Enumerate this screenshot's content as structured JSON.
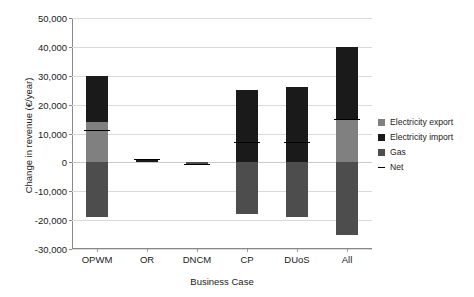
{
  "chart_data": {
    "type": "bar",
    "subtype": "stacked-bar-with-negative",
    "title": "",
    "xlabel": "Business Case",
    "ylabel": "Change in revenue (€/year)",
    "categories": [
      "OPWM",
      "OR",
      "DNCM",
      "CP",
      "DUoS",
      "All"
    ],
    "ylim": [
      -30000,
      50000
    ],
    "ytick_step": 10000,
    "ytick_labels": [
      "50,000",
      "40,000",
      "30,000",
      "20,000",
      "10,000",
      "0",
      "-10,000",
      "-20,000",
      "-30,000"
    ],
    "ytick_values": [
      50000,
      40000,
      30000,
      20000,
      10000,
      0,
      -10000,
      -20000,
      -30000
    ],
    "grid": true,
    "legend_position": "right",
    "series": [
      {
        "name": "Electricity export",
        "color": "#808080",
        "values": [
          14100,
          0,
          0,
          0,
          0,
          15000
        ]
      },
      {
        "name": "Electricity import",
        "color": "#1a1a1a",
        "values": [
          15900,
          1100,
          0,
          25000,
          26000,
          25000
        ]
      },
      {
        "name": "Gas",
        "color": "#4d4d4d",
        "values": [
          -18800,
          0,
          -400,
          -18000,
          -18800,
          -25000
        ]
      }
    ],
    "net": {
      "name": "Net",
      "color": "#000000",
      "values": [
        11200,
        1100,
        -400,
        7000,
        7200,
        15000
      ]
    },
    "legend": [
      {
        "label": "Electricity export",
        "marker": "square",
        "color": "#808080"
      },
      {
        "label": "Electricity import",
        "marker": "square",
        "color": "#1a1a1a"
      },
      {
        "label": "Gas",
        "marker": "square",
        "color": "#4d4d4d"
      },
      {
        "label": "Net",
        "marker": "line",
        "color": "#000000"
      }
    ]
  }
}
